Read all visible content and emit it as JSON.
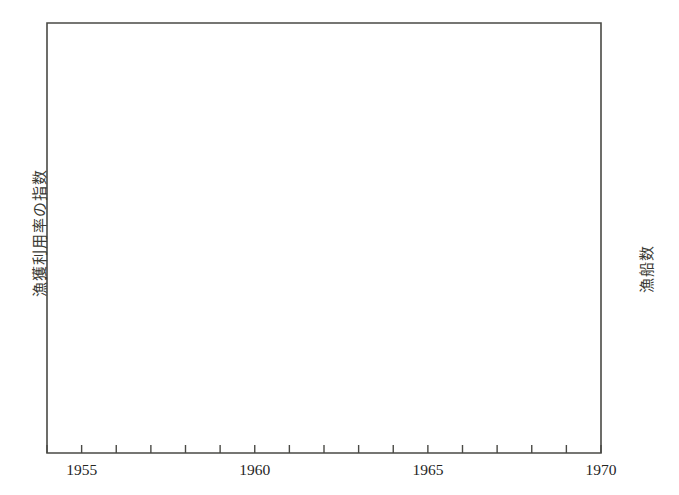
{
  "chart_data": {
    "type": "line",
    "title": "",
    "xlabel": "",
    "ylabel_left": "漁獲利用率の指数",
    "ylabel_right": "漁船数",
    "x": [
      1954,
      1955,
      1956,
      1957,
      1958,
      1959,
      1960,
      1961,
      1962,
      1963,
      1964,
      1965,
      1966,
      1967,
      1968,
      1969,
      1970
    ],
    "xlim": [
      1954,
      1970
    ],
    "xticklabels": [
      "1955",
      "1960",
      "1965",
      "1970"
    ],
    "xtickvalues": [
      1955,
      1960,
      1965,
      1970
    ],
    "ylim_right": [
      0,
      2720
    ],
    "yticklabels_right": [
      "2,400",
      "1,600",
      "800"
    ],
    "ytickvalues_right": [
      2400,
      1600,
      800
    ],
    "yminor_right": [
      2000,
      1200,
      400
    ],
    "grid": false,
    "legend": "none",
    "series": [
      {
        "name": "漁獲利用率の指数",
        "style": "solid-with-circle-markers",
        "markers": true,
        "values": [
          1120,
          1440,
          1560,
          1300,
          1450,
          1480,
          1340,
          950,
          880,
          780,
          780,
          770,
          650,
          640,
          530,
          380,
          320
        ]
      },
      {
        "name": "漁船数",
        "style": "dashed",
        "markers": false,
        "values": [
          840,
          2440,
          1720,
          1230,
          1940,
          1760,
          700,
          1860,
          1160,
          1290,
          560,
          1710,
          900,
          410,
          390,
          370,
          330
        ]
      }
    ]
  },
  "axes": {
    "left_ticks_count": 6,
    "right_ticks_count": 6,
    "x_ticks_count": 17
  },
  "colors": {
    "ink": "#3a3a33",
    "axis": "#4a4a45",
    "background": "#ffffff"
  }
}
